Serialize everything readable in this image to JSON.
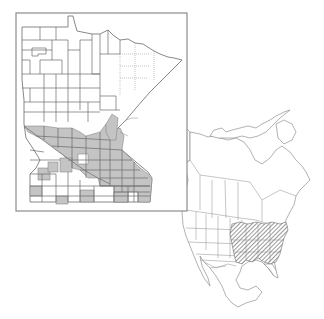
{
  "figure": {
    "type": "species-distribution-map",
    "inset_map": {
      "region": "Minnesota",
      "description": "County map of Minnesota; shaded counties indicate documented occurrence",
      "legend_fill_present": "#c4c4c4",
      "legend_fill_absent": "#ffffff",
      "frame_color": "#8c8c8c",
      "shaded_area": "southern and central-southeast Minnesota counties"
    },
    "continental_map": {
      "region": "North America",
      "description": "Outline map of North America with state/province borders; hatched area indicates overall range",
      "range_pattern": "diagonal-hatch",
      "range_color": "#555555",
      "range_extent": "eastern United States (Midwest to Atlantic coast, south to Gulf states)"
    }
  }
}
